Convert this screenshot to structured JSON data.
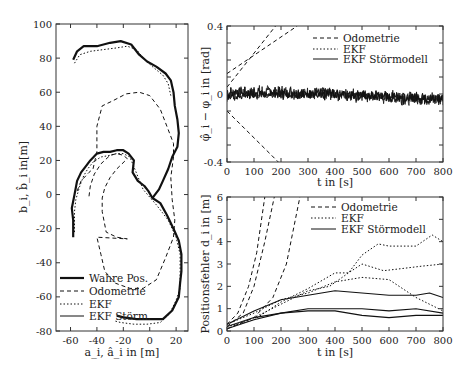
{
  "chart_data": [
    {
      "type": "line",
      "panel": "trajectory",
      "xlabel": "a_i, â_i in [m]",
      "ylabel": "b_i, b̂_i in[m]",
      "xlim": [
        -71,
        29
      ],
      "ylim": [
        -80,
        100
      ],
      "xticks": [
        -60,
        -40,
        -20,
        0,
        20
      ],
      "yticks": [
        -80,
        -60,
        -40,
        -20,
        0,
        20,
        40,
        60,
        80,
        100
      ],
      "legend": {
        "position": "lower left",
        "entries": [
          "Wahre Pos.",
          "Odometrie",
          "EKF",
          "EKF Störm."
        ]
      },
      "series": [
        {
          "name": "Wahre Pos.",
          "style": "solid-thick",
          "points": [
            [
              -58,
              -25
            ],
            [
              -58,
              -15
            ],
            [
              -59,
              -8
            ],
            [
              -57,
              0
            ],
            [
              -55,
              8
            ],
            [
              -52,
              13
            ],
            [
              -49,
              16
            ],
            [
              -45,
              20
            ],
            [
              -40,
              24
            ],
            [
              -35,
              25
            ],
            [
              -30,
              25
            ],
            [
              -25,
              26
            ],
            [
              -20,
              26
            ],
            [
              -16,
              24
            ],
            [
              -12,
              20
            ],
            [
              -13,
              13
            ],
            [
              -9,
              8
            ],
            [
              -4,
              5
            ],
            [
              -1,
              2
            ],
            [
              2,
              -2
            ],
            [
              8,
              -5
            ],
            [
              13,
              -12
            ],
            [
              18,
              -20
            ],
            [
              22,
              -27
            ],
            [
              24,
              -35
            ],
            [
              24,
              -45
            ],
            [
              23,
              -52
            ],
            [
              22,
              -60
            ],
            [
              17,
              -68
            ],
            [
              10,
              -73
            ],
            [
              0,
              -73
            ],
            [
              -10,
              -73
            ],
            [
              -20,
              -72
            ],
            [
              -25,
              -71
            ]
          ]
        },
        {
          "name": "Wahre Pos. (upper)",
          "style": "solid-thick",
          "points": [
            [
              -58,
              79
            ],
            [
              -55,
              84
            ],
            [
              -50,
              87
            ],
            [
              -40,
              87
            ],
            [
              -30,
              89
            ],
            [
              -22,
              90
            ],
            [
              -14,
              88
            ],
            [
              -8,
              82
            ],
            [
              -2,
              78
            ],
            [
              5,
              75
            ],
            [
              12,
              71
            ],
            [
              16,
              67
            ],
            [
              18,
              60
            ],
            [
              19,
              52
            ],
            [
              21,
              44
            ],
            [
              22,
              36
            ],
            [
              21,
              28
            ],
            [
              17,
              22
            ],
            [
              14,
              15
            ],
            [
              10,
              8
            ],
            [
              7,
              3
            ],
            [
              4,
              0
            ],
            [
              2,
              -2
            ]
          ]
        },
        {
          "name": "Odometrie",
          "style": "dashed",
          "points": [
            [
              -46,
              -1
            ],
            [
              -45,
              5
            ],
            [
              -42,
              12
            ],
            [
              -37,
              18
            ],
            [
              -30,
              23
            ],
            [
              -25,
              24
            ],
            [
              -20,
              23
            ],
            [
              -17,
              21
            ],
            [
              -25,
              15
            ],
            [
              -30,
              10
            ],
            [
              -34,
              4
            ],
            [
              -36,
              -2
            ],
            [
              -36,
              -10
            ],
            [
              -33,
              -22
            ],
            [
              -25,
              -25
            ],
            [
              -17,
              -26
            ],
            [
              -40,
              -25
            ],
            [
              -37,
              -35
            ],
            [
              -34,
              -45
            ],
            [
              -26,
              -52
            ],
            [
              -15,
              -55
            ],
            [
              -5,
              -55
            ],
            [
              5,
              -50
            ],
            [
              12,
              -37
            ],
            [
              18,
              -25
            ],
            [
              19,
              -15
            ],
            [
              17,
              -3
            ],
            [
              16,
              10
            ],
            [
              18,
              22
            ],
            [
              18,
              30
            ],
            [
              13,
              40
            ],
            [
              8,
              50
            ],
            [
              0,
              58
            ],
            [
              -8,
              60
            ],
            [
              -18,
              59
            ],
            [
              -28,
              55
            ],
            [
              -36,
              52
            ],
            [
              -40,
              40
            ],
            [
              -40,
              25
            ],
            [
              -43,
              15
            ],
            [
              -46,
              13
            ],
            [
              -52,
              8
            ],
            [
              -55,
              2
            ]
          ]
        },
        {
          "name": "EKF",
          "style": "dotted",
          "points": [
            [
              -57,
              -22
            ],
            [
              -57,
              -10
            ],
            [
              -56,
              -3
            ],
            [
              -53,
              5
            ],
            [
              -50,
              11
            ],
            [
              -47,
              15
            ],
            [
              -43,
              19
            ],
            [
              -37,
              22
            ],
            [
              -30,
              23
            ],
            [
              -25,
              24
            ],
            [
              -20,
              24
            ],
            [
              -15,
              22
            ],
            [
              -5,
              3
            ],
            [
              5,
              -6
            ],
            [
              14,
              -15
            ],
            [
              20,
              -25
            ],
            [
              23,
              -35
            ],
            [
              23,
              -45
            ],
            [
              23,
              -55
            ],
            [
              20,
              -62
            ],
            [
              15,
              -70
            ],
            [
              8,
              -75
            ],
            [
              -2,
              -76
            ],
            [
              -12,
              -76
            ],
            [
              -22,
              -75
            ],
            [
              -27,
              -74
            ]
          ]
        },
        {
          "name": "EKF (upper)",
          "style": "dotted",
          "points": [
            [
              -57,
              77
            ],
            [
              -53,
              82
            ],
            [
              -45,
              84
            ],
            [
              -35,
              85
            ],
            [
              -25,
              86
            ],
            [
              -17,
              87
            ],
            [
              -10,
              85
            ],
            [
              -5,
              80
            ],
            [
              2,
              75
            ],
            [
              10,
              70
            ],
            [
              14,
              65
            ],
            [
              16,
              58
            ]
          ]
        }
      ]
    },
    {
      "type": "line",
      "panel": "heading-error",
      "xlabel": "t in [s]",
      "ylabel": "φ̂_i − φ_i in [rad]",
      "xlim": [
        0,
        800
      ],
      "ylim": [
        -0.4,
        0.4
      ],
      "xticks": [
        0,
        100,
        200,
        300,
        400,
        500,
        600,
        700,
        800
      ],
      "yticks": [
        -0.4,
        0,
        0.4
      ],
      "legend": {
        "position": "upper right",
        "entries": [
          "Odometrie",
          "EKF",
          "EKF Störmodell"
        ]
      },
      "series": [
        {
          "name": "Odometrie",
          "style": "dashed",
          "points": [
            [
              0,
              0.12
            ],
            [
              260,
              0.4
            ]
          ]
        },
        {
          "name": "Odometrie",
          "style": "dashed",
          "points": [
            [
              0,
              0.04
            ],
            [
              180,
              0.4
            ]
          ]
        },
        {
          "name": "Odometrie",
          "style": "dashed",
          "points": [
            [
              0,
              -0.1
            ],
            [
              190,
              -0.4
            ]
          ]
        },
        {
          "name": "EKF",
          "style": "noisy",
          "mean": [
            [
              0,
              0.01
            ],
            [
              200,
              0.01
            ],
            [
              400,
              0.0
            ],
            [
              600,
              -0.02
            ],
            [
              800,
              -0.03
            ]
          ],
          "noise": 0.03
        },
        {
          "name": "EKF Störmodell",
          "style": "noisy",
          "mean": [
            [
              0,
              -0.02
            ],
            [
              100,
              0.0
            ],
            [
              400,
              0.0
            ],
            [
              800,
              -0.03
            ]
          ],
          "noise": 0.02
        }
      ]
    },
    {
      "type": "line",
      "panel": "position-error",
      "xlabel": "t in [s]",
      "ylabel": "Positionsfehler d_i in [m]",
      "xlim": [
        0,
        800
      ],
      "ylim": [
        0,
        6
      ],
      "xticks": [
        0,
        100,
        200,
        300,
        400,
        500,
        600,
        700,
        800
      ],
      "yticks": [
        0,
        1,
        2,
        3,
        4,
        5,
        6
      ],
      "legend": {
        "position": "upper right",
        "entries": [
          "Odometrie",
          "EKF",
          "EKF Störmodell"
        ]
      },
      "series": [
        {
          "name": "Odometrie",
          "style": "dashed",
          "points": [
            [
              0,
              0.3
            ],
            [
              40,
              0.8
            ],
            [
              80,
              2
            ],
            [
              110,
              3.5
            ],
            [
              140,
              6
            ]
          ]
        },
        {
          "name": "Odometrie",
          "style": "dashed",
          "points": [
            [
              0,
              0.2
            ],
            [
              60,
              0.8
            ],
            [
              100,
              2
            ],
            [
              140,
              4
            ],
            [
              175,
              6
            ]
          ]
        },
        {
          "name": "Odometrie",
          "style": "dashed",
          "points": [
            [
              0,
              0.1
            ],
            [
              100,
              0.6
            ],
            [
              170,
              1.5
            ],
            [
              220,
              3
            ],
            [
              270,
              6
            ]
          ]
        },
        {
          "name": "EKF",
          "style": "dotted",
          "points": [
            [
              0,
              0.2
            ],
            [
              100,
              0.5
            ],
            [
              200,
              1.3
            ],
            [
              300,
              1.9
            ],
            [
              400,
              2.6
            ],
            [
              450,
              2.6
            ],
            [
              500,
              3.4
            ],
            [
              560,
              3.9
            ],
            [
              600,
              3.8
            ],
            [
              700,
              3.8
            ],
            [
              760,
              4.3
            ],
            [
              800,
              4.0
            ]
          ]
        },
        {
          "name": "EKF",
          "style": "dotted",
          "points": [
            [
              0,
              0.1
            ],
            [
              100,
              0.6
            ],
            [
              200,
              1.2
            ],
            [
              300,
              1.8
            ],
            [
              380,
              2.0
            ],
            [
              450,
              2.6
            ],
            [
              500,
              3.0
            ],
            [
              580,
              2.7
            ],
            [
              650,
              2.8
            ],
            [
              720,
              2.9
            ],
            [
              800,
              3.0
            ]
          ]
        },
        {
          "name": "EKF",
          "style": "dotted",
          "points": [
            [
              0,
              0.3
            ],
            [
              100,
              0.8
            ],
            [
              200,
              1.4
            ],
            [
              300,
              1.7
            ],
            [
              400,
              2.2
            ],
            [
              500,
              2.4
            ],
            [
              600,
              2.3
            ],
            [
              700,
              1.5
            ],
            [
              800,
              0.9
            ]
          ]
        },
        {
          "name": "EKF Störmodell",
          "style": "solid",
          "points": [
            [
              0,
              0.3
            ],
            [
              100,
              0.9
            ],
            [
              200,
              1.4
            ],
            [
              300,
              1.6
            ],
            [
              400,
              1.8
            ],
            [
              500,
              1.7
            ],
            [
              600,
              1.6
            ],
            [
              700,
              1.6
            ],
            [
              750,
              1.7
            ],
            [
              800,
              1.5
            ]
          ]
        },
        {
          "name": "EKF Störmodell",
          "style": "solid",
          "points": [
            [
              0,
              0.2
            ],
            [
              100,
              0.6
            ],
            [
              200,
              0.8
            ],
            [
              300,
              1.0
            ],
            [
              400,
              1.0
            ],
            [
              500,
              1.0
            ],
            [
              600,
              0.9
            ],
            [
              700,
              1.0
            ],
            [
              800,
              0.8
            ]
          ]
        },
        {
          "name": "EKF Störmodell",
          "style": "solid",
          "points": [
            [
              0,
              0.1
            ],
            [
              100,
              0.5
            ],
            [
              200,
              0.8
            ],
            [
              300,
              0.9
            ],
            [
              400,
              0.9
            ],
            [
              500,
              0.7
            ],
            [
              600,
              0.6
            ],
            [
              700,
              0.7
            ],
            [
              800,
              0.7
            ]
          ]
        }
      ]
    }
  ],
  "labels": {
    "left": {
      "xlabel": "a_i, â_i in [m]",
      "ylabel": "b_i, b̂_i in[m]"
    },
    "topright": {
      "xlabel": "t in [s]",
      "ylabel": "φ̂_i − φ_i in [rad]"
    },
    "bottomright": {
      "xlabel": "t in [s]",
      "ylabel": "Positionsfehler d_i in [m]"
    }
  },
  "legends": {
    "left": [
      "Wahre Pos.",
      "Odometrie",
      "EKF",
      "EKF Störm."
    ],
    "right": [
      "Odometrie",
      "EKF",
      "EKF Störmodell"
    ]
  }
}
